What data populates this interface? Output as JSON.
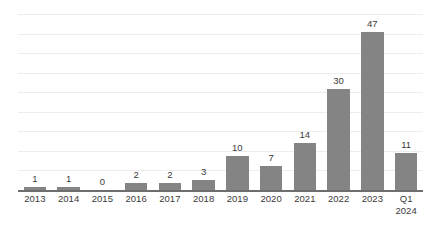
{
  "chart_data": {
    "type": "bar",
    "title": "",
    "subtitle": "",
    "xlabel": "",
    "ylabel": "",
    "categories": [
      "2013",
      "2014",
      "2015",
      "2016",
      "2017",
      "2018",
      "2019",
      "2020",
      "2021",
      "2022",
      "2023",
      "Q1 2024"
    ],
    "category_lines": [
      [
        "2013"
      ],
      [
        "2014"
      ],
      [
        "2015"
      ],
      [
        "2016"
      ],
      [
        "2017"
      ],
      [
        "2018"
      ],
      [
        "2019"
      ],
      [
        "2020"
      ],
      [
        "2021"
      ],
      [
        "2022"
      ],
      [
        "2023"
      ],
      [
        "Q1",
        "2024"
      ]
    ],
    "values": [
      1,
      1,
      0,
      2,
      2,
      3,
      10,
      7,
      14,
      30,
      47,
      11
    ],
    "data_labels": [
      "1",
      "1",
      "0",
      "2",
      "2",
      "3",
      "10",
      "7",
      "14",
      "30",
      "47",
      "11"
    ],
    "ylim": [
      0,
      50
    ],
    "y_tick_interval": 5,
    "y_tick_labels_visible": false,
    "gridlines": {
      "horizontal": true,
      "count": 10,
      "color": "#ededed"
    },
    "legend": {
      "visible": false,
      "position": "none",
      "entries": []
    },
    "series": [
      {
        "name": "Count",
        "color": "#848484",
        "values": [
          1,
          1,
          0,
          2,
          2,
          3,
          10,
          7,
          14,
          30,
          47,
          11
        ]
      }
    ],
    "colors": {
      "bar": "#848484",
      "axis": "#6e6e6e",
      "gridline": "#ededed",
      "label_text": "#3a3a3a",
      "background": "#ffffff"
    },
    "annotations": []
  }
}
